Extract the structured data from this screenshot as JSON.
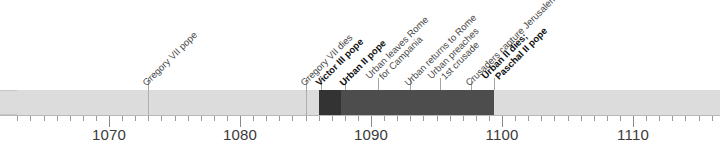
{
  "chart_data": {
    "type": "timeline",
    "title": "",
    "xlabel": "",
    "ylabel": "",
    "axis": {
      "min": 1063,
      "max": 1117,
      "tick_step": 1,
      "major_step": 10,
      "tick_labels": [
        "1070",
        "1080",
        "1090",
        "1100",
        "1110"
      ],
      "tick_label_values": [
        1070,
        1080,
        1090,
        1100,
        1110
      ]
    },
    "segments": [
      {
        "name": "pre-Gregory",
        "start": 1063,
        "end": 1073,
        "shade": "light",
        "color": "#dcdcdc"
      },
      {
        "name": "Gregory VII reign",
        "start": 1073,
        "end": 1085,
        "shade": "light",
        "color": "#dcdcdc"
      },
      {
        "name": "vacancy",
        "start": 1085,
        "end": 1086,
        "shade": "light",
        "color": "#dcdcdc"
      },
      {
        "name": "Victor III reign",
        "start": 1086,
        "end": 1087.7,
        "shade": "darkest",
        "color": "#333333"
      },
      {
        "name": "Urban II reign",
        "start": 1087.7,
        "end": 1099.4,
        "shade": "dark",
        "color": "#4d4d4d"
      },
      {
        "name": "Paschal II reign",
        "start": 1099.4,
        "end": 1117,
        "shade": "light",
        "color": "#dcdcdc"
      }
    ],
    "events": [
      {
        "year": 1073,
        "lines": [
          "Gregory VII pope"
        ],
        "bold": false
      },
      {
        "year": 1085,
        "lines": [
          "Gregory VII dies"
        ],
        "bold": false
      },
      {
        "year": 1086.2,
        "lines": [
          "Victor III pope"
        ],
        "bold": true
      },
      {
        "year": 1088,
        "lines": [
          "Urban II pope"
        ],
        "bold": true
      },
      {
        "year": 1090.5,
        "lines": [
          "Urban leaves Rome",
          "for Campania"
        ],
        "bold": false
      },
      {
        "year": 1093,
        "lines": [
          "Urban returns to Rome"
        ],
        "bold": false
      },
      {
        "year": 1095.3,
        "lines": [
          "Urban preaches",
          "1st crusade"
        ],
        "bold": false
      },
      {
        "year": 1097.6,
        "lines": [
          "Crusaders capture Jerusalem"
        ],
        "bold": false
      },
      {
        "year": 1099.4,
        "lines": [
          "Urban II dies;",
          "Paschal II pope"
        ],
        "bold": true
      }
    ]
  },
  "colors": {
    "bar_light": "#dcdcdc",
    "bar_dark": "#4d4d4d",
    "bar_darkest": "#333333",
    "axis": "#9a9a9a",
    "label_text": "#4a4a4a",
    "bold_text": "#111111",
    "background": "#ffffff"
  }
}
